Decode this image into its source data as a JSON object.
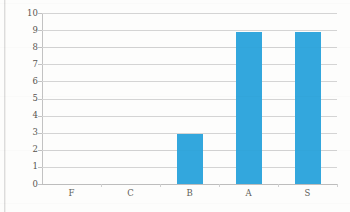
{
  "chart_data": {
    "type": "bar",
    "title": "",
    "subtitle": "",
    "xlabel": "",
    "ylabel": "",
    "categories": [
      "F",
      "C",
      "B",
      "A",
      "S"
    ],
    "values": [
      0,
      0,
      2.9,
      8.9,
      8.9
    ],
    "series": [
      {
        "name": "",
        "values": [
          0,
          0,
          2.9,
          8.9,
          8.9
        ]
      }
    ],
    "ylim": [
      0,
      10
    ],
    "y_ticks": [
      0,
      1,
      2,
      3,
      4,
      5,
      6,
      7,
      8,
      9,
      10
    ],
    "y_tick_labels": [
      "0",
      "1",
      "2",
      "3",
      "4",
      "5",
      "6",
      "7",
      "8",
      "9",
      "10"
    ],
    "grid": true,
    "grid_axis": "y",
    "legend": false,
    "legend_position": "none",
    "bar_color": "#33a7dd",
    "grid_color": "#d4d4d4",
    "axis_color": "#c2c2c2",
    "background_color": "#fdfdfc",
    "tick_label_color": "#56534f"
  }
}
